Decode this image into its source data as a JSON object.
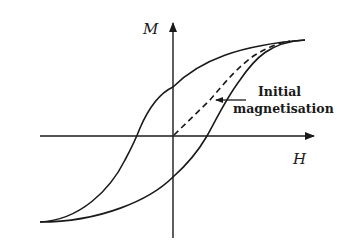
{
  "diagram": {
    "axes": {
      "y_label": "M",
      "x_label": "H"
    },
    "annotation": {
      "line1": "Initial",
      "line2": "magnetisation"
    },
    "colors": {
      "stroke": "#1a1a1a",
      "background": "#ffffff"
    },
    "elements": [
      "vertical M axis with arrow",
      "horizontal H axis with arrow",
      "upper hysteresis branch (solid)",
      "lower hysteresis branch (solid)",
      "initial magnetisation curve (dashed)",
      "annotation arrow pointing to dashed curve"
    ]
  }
}
